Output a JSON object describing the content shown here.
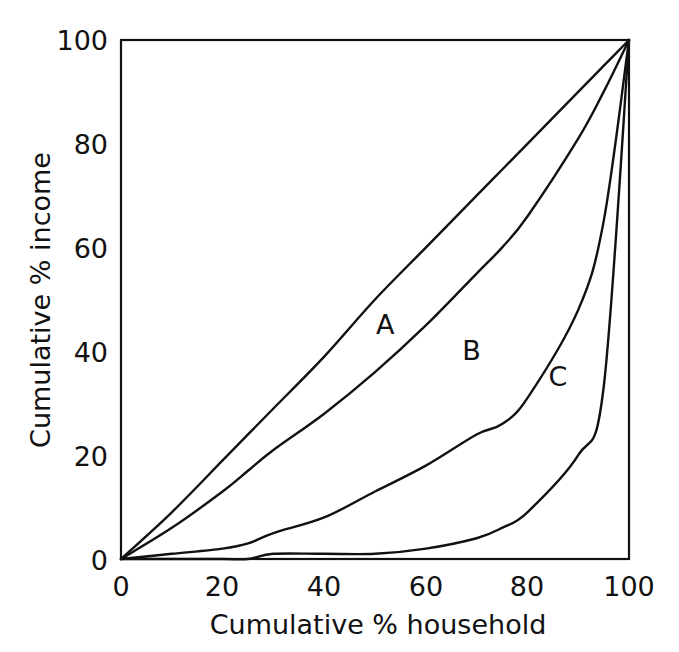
{
  "chart_data": {
    "type": "line",
    "title": "",
    "subtitle": "",
    "xlabel": "Cumulative % household",
    "ylabel": "Cumulative % income",
    "xlim": [
      0,
      100
    ],
    "ylim": [
      0,
      100
    ],
    "x_ticks": [
      "0",
      "20",
      "40",
      "60",
      "80",
      "100"
    ],
    "x_tick_values": [
      0,
      20,
      40,
      60,
      80,
      100
    ],
    "y_ticks": [
      "0",
      "20",
      "40",
      "60",
      "80",
      "100"
    ],
    "y_tick_values": [
      0,
      20,
      40,
      60,
      80,
      100
    ],
    "grid": false,
    "legend": "inline-curve-labels",
    "x": [
      0,
      10,
      20,
      25,
      30,
      40,
      50,
      60,
      70,
      75,
      80,
      90,
      95,
      100
    ],
    "series": [
      {
        "name": "A",
        "label": "A",
        "label_x": 52,
        "label_y": 45,
        "values": [
          0,
          9,
          19,
          24,
          29,
          39,
          50,
          60,
          70,
          75,
          80,
          90,
          95,
          100
        ]
      },
      {
        "name": "B",
        "label": "B",
        "label_x": 69,
        "label_y": 40,
        "values": [
          0,
          6,
          13,
          17,
          21,
          28,
          36,
          45,
          55,
          60,
          66,
          81,
          90,
          100
        ]
      },
      {
        "name": "C",
        "label": "C",
        "label_x": 86,
        "label_y": 35,
        "values": [
          0,
          1,
          2,
          3,
          5,
          8,
          13,
          18,
          24,
          26,
          31,
          48,
          65,
          100
        ]
      },
      {
        "name": "D",
        "label": "",
        "label_x": null,
        "label_y": null,
        "values": [
          0,
          0,
          0,
          0,
          1,
          1,
          1,
          2,
          4,
          6,
          9,
          20,
          33,
          100
        ]
      }
    ],
    "curve_labels": [
      "A",
      "B",
      "C"
    ],
    "colors": {
      "curve": "#111111",
      "axis": "#111111",
      "background": "#ffffff",
      "text": "#111111"
    }
  },
  "axes": {
    "x_title": "Cumulative % household",
    "y_title": "Cumulative % income",
    "x_tick_labels": [
      "0",
      "20",
      "40",
      "60",
      "80",
      "100"
    ],
    "y_tick_labels": [
      "0",
      "20",
      "40",
      "60",
      "80",
      "100"
    ]
  },
  "labels": {
    "a": "A",
    "b": "B",
    "c": "C"
  }
}
